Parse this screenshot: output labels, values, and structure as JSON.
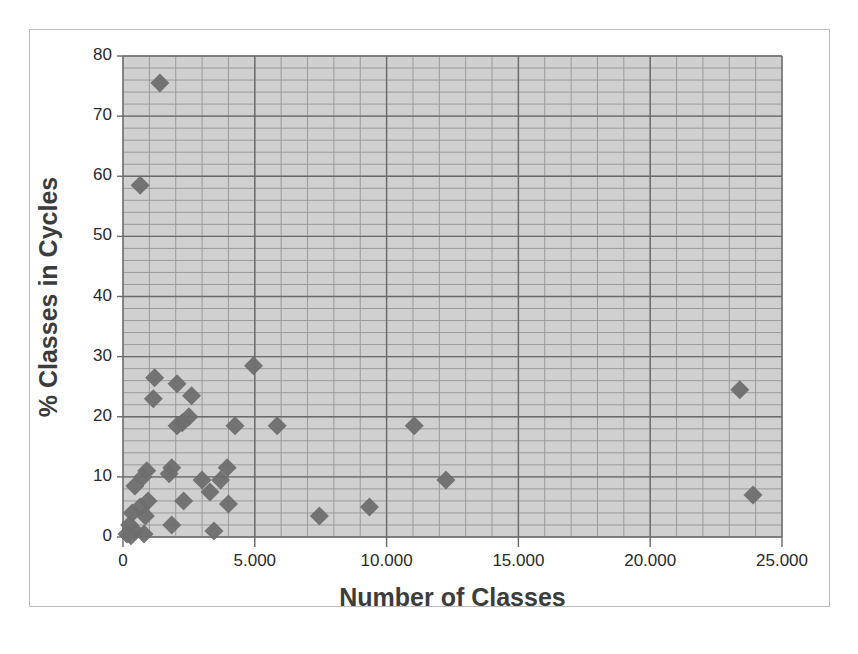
{
  "chart_data": {
    "type": "scatter",
    "title": "",
    "xlabel": "Number of Classes",
    "ylabel": "% Classes in Cycles",
    "xlim": [
      0,
      25000
    ],
    "ylim": [
      0,
      80
    ],
    "x_ticks": [
      "0",
      "5.000",
      "10.000",
      "15.000",
      "20.000",
      "25.000"
    ],
    "y_ticks": [
      "0",
      "10",
      "20",
      "30",
      "40",
      "50",
      "60",
      "70",
      "80"
    ],
    "grid": true,
    "legend": null,
    "marker": "diamond",
    "marker_color": "#6e6e6e",
    "background_color": "#d0d0d0",
    "series": [
      {
        "name": "Systems",
        "points": [
          {
            "x": 1400,
            "y": 75.5
          },
          {
            "x": 650,
            "y": 58.5
          },
          {
            "x": 4950,
            "y": 28.5
          },
          {
            "x": 1200,
            "y": 26.5
          },
          {
            "x": 2050,
            "y": 25.5
          },
          {
            "x": 2600,
            "y": 23.5
          },
          {
            "x": 1150,
            "y": 23.0
          },
          {
            "x": 2500,
            "y": 20.0
          },
          {
            "x": 2250,
            "y": 19.0
          },
          {
            "x": 2050,
            "y": 18.5
          },
          {
            "x": 4250,
            "y": 18.5
          },
          {
            "x": 5850,
            "y": 18.5
          },
          {
            "x": 11050,
            "y": 18.5
          },
          {
            "x": 23400,
            "y": 24.5
          },
          {
            "x": 900,
            "y": 11.0
          },
          {
            "x": 1850,
            "y": 11.5
          },
          {
            "x": 3950,
            "y": 11.5
          },
          {
            "x": 750,
            "y": 10.0
          },
          {
            "x": 1750,
            "y": 10.5
          },
          {
            "x": 450,
            "y": 8.5
          },
          {
            "x": 3000,
            "y": 9.5
          },
          {
            "x": 3700,
            "y": 9.5
          },
          {
            "x": 3300,
            "y": 7.5
          },
          {
            "x": 12250,
            "y": 9.5
          },
          {
            "x": 23900,
            "y": 7.0
          },
          {
            "x": 2300,
            "y": 6.0
          },
          {
            "x": 950,
            "y": 6.0
          },
          {
            "x": 4000,
            "y": 5.5
          },
          {
            "x": 650,
            "y": 5.0
          },
          {
            "x": 350,
            "y": 4.0
          },
          {
            "x": 850,
            "y": 3.5
          },
          {
            "x": 7450,
            "y": 3.5
          },
          {
            "x": 9350,
            "y": 5.0
          },
          {
            "x": 1850,
            "y": 2.0
          },
          {
            "x": 250,
            "y": 2.0
          },
          {
            "x": 450,
            "y": 1.0
          },
          {
            "x": 3450,
            "y": 1.0
          },
          {
            "x": 800,
            "y": 0.5
          },
          {
            "x": 300,
            "y": 0.2
          },
          {
            "x": 150,
            "y": 0.5
          }
        ]
      }
    ]
  }
}
